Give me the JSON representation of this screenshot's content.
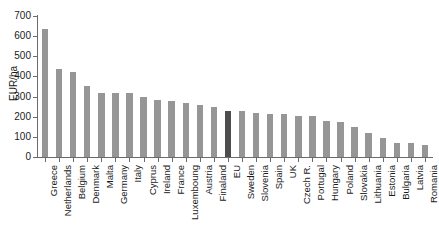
{
  "chart_data": {
    "type": "bar",
    "title": "",
    "subtitle": "",
    "xlabel": "",
    "ylabel": "EUR/ha",
    "ylim": [
      0,
      700
    ],
    "yticks": [
      0,
      100,
      200,
      300,
      400,
      500,
      600,
      700
    ],
    "grid": false,
    "legend": "none",
    "highlight_category": "EU",
    "colors": {
      "bar": "#969696",
      "bar_highlight": "#4d4d4d",
      "axis": "#6b6b6b",
      "text": "#1a1a1a",
      "background": "#ffffff"
    },
    "categories": [
      "Greece",
      "Netherlands",
      "Belgium",
      "Denmark",
      "Malta",
      "Germany",
      "Italy",
      "Cyprus",
      "Ireland",
      "France",
      "Luxemboung",
      "Austria",
      "Finaland",
      "EU",
      "Sweden",
      "Slovenia",
      "Spain",
      "UK",
      "Czech R.",
      "Portugal",
      "Hungary",
      "Poland",
      "Slovakia",
      "Lithuania",
      "Estonia",
      "Bulgaria",
      "Latvia",
      "Romania"
    ],
    "values": [
      635,
      438,
      422,
      352,
      320,
      318,
      317,
      297,
      283,
      276,
      268,
      257,
      246,
      230,
      228,
      218,
      216,
      212,
      205,
      204,
      178,
      176,
      150,
      120,
      95,
      72,
      68,
      58
    ],
    "units": "EUR/ha"
  }
}
